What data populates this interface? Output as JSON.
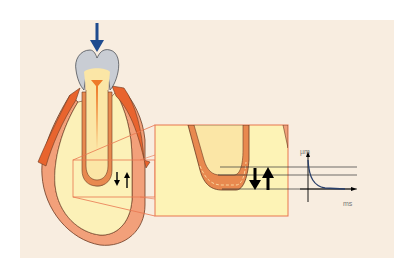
{
  "diagram": {
    "labels": {
      "y_axis": "µm",
      "x_axis": "ms"
    },
    "colors": {
      "page_bg": "#ffffff",
      "panel_bg": "#f8ede0",
      "bone_fill": "#fcf1b8",
      "bone_cortex": "#f2a07a",
      "gingiva": "#e8642e",
      "crown": "#c9cdd4",
      "dentin": "#fbe6a6",
      "pulp": "#ee7a2a",
      "ligament": "#e8894f",
      "load_arrow": "#1f4b8e",
      "zoom_box": "#e8764f",
      "inset_bg": "#fdf3b6",
      "graph_curve": "#2a3f6a"
    },
    "elements": {
      "load_arrow": "Downward occlusal force arrow",
      "inset": "Magnified view of root apex and periodontal ligament",
      "movement_arrows": "Down/up displacement arrows",
      "graph": "Displacement (µm) over time (ms) decay curve"
    }
  }
}
